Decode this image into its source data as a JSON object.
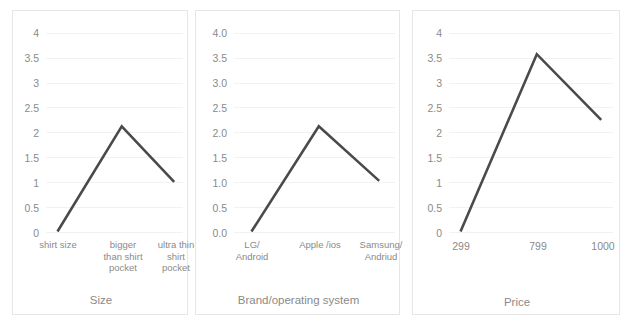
{
  "figure": {
    "background": "#ffffff",
    "panel_border_color": "#e6e6e6",
    "gridline_color": "#f2f2f2",
    "line_color": "#4a4a4a",
    "text_color": "#8a8a8a"
  },
  "chart_data": [
    {
      "type": "line",
      "title": "",
      "xlabel": "Size",
      "ylabel": "",
      "categories": [
        "shirt size",
        "bigger than shirt pocket",
        "ultra thin shirt pocket"
      ],
      "category_lines": [
        [
          "shirt size"
        ],
        [
          "bigger",
          "than shirt",
          "pocket"
        ],
        [
          "ultra thin",
          "shirt",
          "pocket"
        ]
      ],
      "values": [
        0,
        2.12,
        1.0
      ],
      "ytick_labels": [
        "4",
        "3.5",
        "3",
        "2.5",
        "2",
        "1.5",
        "1",
        "0.5",
        "0"
      ],
      "ytick_values": [
        4,
        3.5,
        3,
        2.5,
        2,
        1.5,
        1,
        0.5,
        0
      ],
      "ylim": [
        0,
        4
      ],
      "grid": true,
      "legend": false
    },
    {
      "type": "line",
      "title": "",
      "xlabel": "Brand/operating system",
      "ylabel": "",
      "categories": [
        "LG/ Android",
        "Apple /ios",
        "Samsung/ Andriud"
      ],
      "category_lines": [
        [
          "LG/",
          "Android"
        ],
        [
          "Apple /ios"
        ],
        [
          "Samsung/",
          "Andriud"
        ]
      ],
      "values": [
        0,
        2.12,
        1.02
      ],
      "ytick_labels": [
        "4.0",
        "3.5",
        "3.0",
        "2.5",
        "2.0",
        "1.5",
        "1.0",
        "0.5",
        "0.0"
      ],
      "ytick_values": [
        4,
        3.5,
        3,
        2.5,
        2,
        1.5,
        1,
        0.5,
        0
      ],
      "ylim": [
        0,
        4
      ],
      "grid": true,
      "legend": false
    },
    {
      "type": "line",
      "title": "",
      "xlabel": "Price",
      "ylabel": "",
      "categories": [
        "299",
        "799",
        "1000"
      ],
      "category_lines": [
        [
          "299"
        ],
        [
          "799"
        ],
        [
          "1000"
        ]
      ],
      "values": [
        0,
        3.57,
        2.25
      ],
      "ytick_labels": [
        "4",
        "3.5",
        "3",
        "2.5",
        "2",
        "1.5",
        "1",
        "0.5",
        "0"
      ],
      "ytick_values": [
        4,
        3.5,
        3,
        2.5,
        2,
        1.5,
        1,
        0.5,
        0
      ],
      "ylim": [
        0,
        4
      ],
      "grid": true,
      "legend": false
    }
  ]
}
